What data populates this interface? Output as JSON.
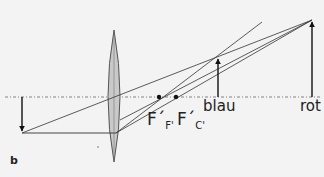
{
  "figure": {
    "panel_label": "b",
    "labels": {
      "image_blue": "blau",
      "image_red": "rot",
      "focal_blue": {
        "main": "F´",
        "sub": "F'"
      },
      "focal_red": {
        "main": "F´",
        "sub": "C'"
      }
    },
    "colors": {
      "background": "#f3f3f3",
      "lines": "#333333",
      "lens_fill": "#c9c9c9",
      "lens_stroke": "#555555",
      "axis": "#666666"
    },
    "geometry": {
      "optical_axis_y": 97,
      "object_arrow": {
        "x": 22,
        "y_base": 97,
        "y_tip": 133
      },
      "lens": {
        "x": 114,
        "y_top": 36,
        "y_bottom": 158
      },
      "focal_points": [
        {
          "name": "F'F'",
          "x": 159,
          "y": 97
        },
        {
          "name": "F'C'",
          "x": 176,
          "y": 97
        }
      ],
      "image_arrows": [
        {
          "name": "blau",
          "x": 218,
          "y_base": 97,
          "y_tip": 57
        },
        {
          "name": "rot",
          "x": 312,
          "y_base": 97,
          "y_tip": 20
        }
      ]
    }
  }
}
